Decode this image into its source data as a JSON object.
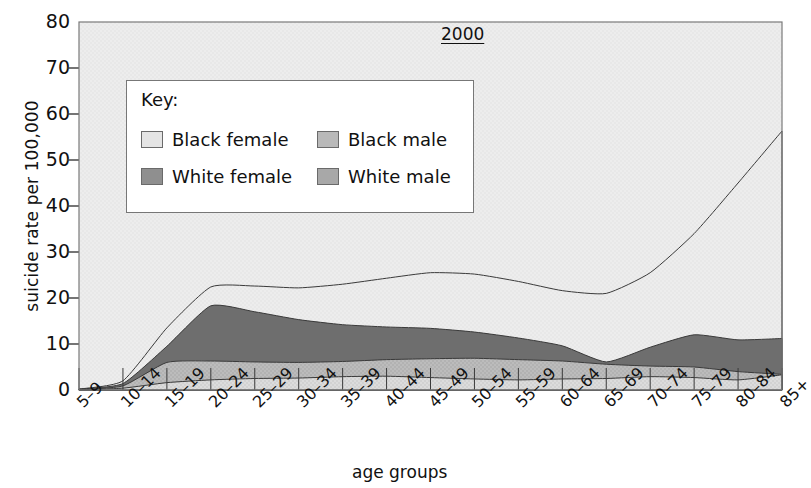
{
  "chart_data": {
    "type": "area",
    "title": "2000",
    "xlabel": "age groups",
    "ylabel": "suicide rate per 100,000",
    "ylim": [
      0,
      80
    ],
    "yticks": [
      0,
      10,
      20,
      30,
      40,
      50,
      60,
      70,
      80
    ],
    "grid": false,
    "legend_position": "upper-left-inside",
    "stacked": false,
    "note": "Four overlaid (not stacked) filled area curves; white male is the outermost/highest curve, then white female, then black male, then black female lowest.",
    "categories": [
      "5–9",
      "10–14",
      "15–19",
      "20–24",
      "25–29",
      "30–34",
      "35–39",
      "40–44",
      "45–49",
      "50–54",
      "55–59",
      "60–64",
      "65–69",
      "70–74",
      "75–79",
      "80–84",
      "85+"
    ],
    "series": [
      {
        "name": "White male",
        "color": "#efefef",
        "values": [
          0.2,
          2.0,
          13.5,
          22.4,
          22.6,
          22.2,
          23.0,
          24.3,
          25.5,
          25.2,
          23.6,
          21.6,
          21.0,
          25.5,
          34.0,
          45.0,
          56.3
        ]
      },
      {
        "name": "White female",
        "color": "#6e6e6e",
        "values": [
          0.2,
          1.4,
          9.5,
          18.3,
          17.0,
          15.3,
          14.2,
          13.7,
          13.4,
          12.6,
          11.3,
          9.6,
          6.1,
          9.3,
          12.0,
          10.9,
          11.2
        ]
      },
      {
        "name": "Black male",
        "color": "#b8b8b8",
        "values": [
          0.1,
          0.9,
          6.0,
          6.3,
          6.1,
          6.0,
          6.2,
          6.6,
          6.8,
          6.9,
          6.6,
          6.3,
          5.6,
          5.2,
          5.0,
          4.0,
          3.4
        ]
      },
      {
        "name": "Black female",
        "color": "#dcdcdc",
        "values": [
          0.05,
          0.4,
          1.6,
          2.2,
          2.5,
          2.6,
          2.9,
          3.0,
          2.7,
          2.4,
          2.2,
          2.4,
          2.5,
          2.9,
          2.7,
          2.2,
          3.3
        ]
      }
    ]
  },
  "legend": {
    "title": "Key:",
    "entries": [
      {
        "label": "Black female",
        "color": "#e4e4e4"
      },
      {
        "label": "Black male",
        "color": "#b9b9b9"
      },
      {
        "label": "White female",
        "color": "#8f8f8f"
      },
      {
        "label": "White male",
        "color": "#a8a8a8"
      }
    ]
  },
  "axes": {
    "y_tick_labels": [
      "80",
      "70",
      "60",
      "50",
      "40",
      "30",
      "20",
      "10",
      "0"
    ],
    "y_axis_title": "suicide rate per 100,000",
    "x_axis_title": "age groups"
  },
  "colors": {
    "plot_background": "#ececec",
    "plot_border": "#7a7a7a",
    "axis_text": "#111111"
  }
}
